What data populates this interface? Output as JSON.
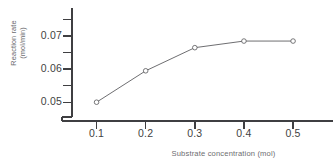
{
  "chart_data": {
    "type": "line",
    "title": "",
    "xlabel": "Substrate concentration (mol)",
    "ylabel_line1": "Reaction rate",
    "ylabel_line2": "(mol/min)",
    "x": [
      0.1,
      0.2,
      0.3,
      0.4,
      0.5
    ],
    "values": [
      0.05,
      0.0595,
      0.0665,
      0.0685,
      0.0685
    ],
    "xticks": [
      "0.1",
      "0.2",
      "0.3",
      "0.4",
      "0.5"
    ],
    "xtick_values": [
      0.1,
      0.2,
      0.3,
      0.4,
      0.5
    ],
    "yticks": [
      "0.05",
      "0.06",
      "0.07"
    ],
    "ytick_values": [
      0.05,
      0.06,
      0.07
    ],
    "y_minor_ticks": [
      0.045,
      0.055,
      0.065,
      0.075
    ],
    "xlim": [
      0.05,
      0.565
    ],
    "ylim": [
      0.0425,
      0.0785
    ],
    "grid": false,
    "legend": null,
    "marker": "open-circle",
    "line_color": "#5e5e61",
    "marker_color": "#5e5e61",
    "axis_color": "#3f3f42",
    "text_color": "#3f3f42"
  }
}
